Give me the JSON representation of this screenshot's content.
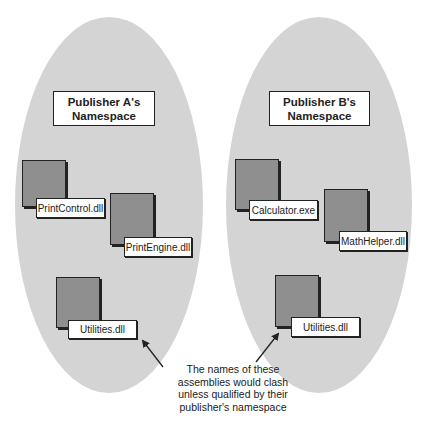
{
  "namespaces": [
    {
      "title_line1": "Publisher A's",
      "title_line2": "Namespace",
      "assemblies": [
        {
          "name": "PrintControl.dll"
        },
        {
          "name": "PrintEngine.dll"
        },
        {
          "name": "Utilities.dll"
        }
      ]
    },
    {
      "title_line1": "Publisher B's",
      "title_line2": "Namespace",
      "assemblies": [
        {
          "name": "Calculator.exe"
        },
        {
          "name": "MathHelper.dll"
        },
        {
          "name": "Utilities.dll"
        }
      ]
    }
  ],
  "callout": {
    "line1": "The names of these",
    "line2": "assemblies would clash",
    "line3": "unless qualified by their",
    "line4": "publisher's namespace"
  },
  "colors": {
    "ellipse_fill": "#d4d4d4",
    "document_fill": "#8f8f8f",
    "outline": "#222222"
  }
}
